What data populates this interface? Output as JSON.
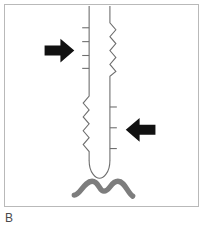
{
  "figure": {
    "panel_label": "B",
    "caption_text": "B",
    "background_color": "#ffffff",
    "border_color": "#b9b9b9",
    "panel": {
      "x": 4,
      "y": 4,
      "width": 195,
      "height": 203
    }
  },
  "colors": {
    "arrow_fill": "#111111",
    "tube_stroke": "#6e6e6e",
    "wave_stroke": "#7d7d7d",
    "border": "#b9b9b9",
    "label_text": "#4a4a4a",
    "background": "#ffffff"
  },
  "elements": {
    "tube": {
      "name": "vertical-tube",
      "left_wall_x": 89,
      "right_wall_x": 110,
      "top_y": 5,
      "tip_y": 162,
      "stroke_width": 1.1,
      "description": "elongated vertical tubular structure with rounded closed tip"
    },
    "upper_segment": {
      "name": "upper-serrated-segment",
      "y_start": 18,
      "y_end": 72,
      "tick_side": "left",
      "zigzag_side": "right",
      "tick_count": 4,
      "zigzag_count": 4
    },
    "mid_segment": {
      "name": "smooth-mid-segment",
      "y_start": 72,
      "y_end": 96,
      "tick_side": "none",
      "zigzag_side": "none"
    },
    "lower_segment": {
      "name": "lower-serrated-segment",
      "y_start": 96,
      "y_end": 158,
      "tick_side": "right",
      "zigzag_side": "left",
      "tick_count": 3,
      "zigzag_count": 5
    },
    "tip": {
      "name": "rounded-tube-tip",
      "center_x": 99.5,
      "y": 162,
      "radius_x": 10.5,
      "radius_y": 11
    },
    "wave": {
      "name": "wavy-baseline",
      "x_start": 74,
      "x_end": 129,
      "y_center": 180,
      "stroke_width": 5.4,
      "humps": 2,
      "description": "thick gray double-hump wavy line beneath the tube tip"
    },
    "arrow_right": {
      "name": "right-pointing-arrow",
      "direction": "right",
      "x": 44,
      "y": 39,
      "width": 30,
      "height": 22
    },
    "arrow_left": {
      "name": "left-pointing-arrow",
      "direction": "left",
      "x": 126,
      "y": 119,
      "width": 30,
      "height": 22
    }
  }
}
